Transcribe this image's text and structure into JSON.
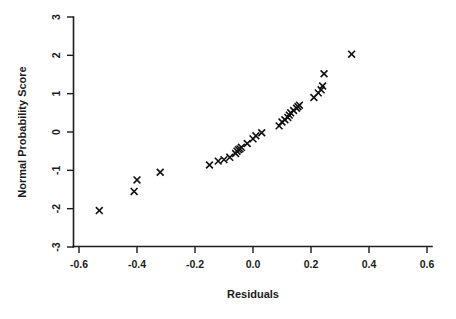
{
  "chart_data": {
    "type": "scatter",
    "title": "",
    "xlabel": "Residuals",
    "ylabel": "Normal Probability Score",
    "xlim": [
      -0.6,
      0.6
    ],
    "ylim": [
      -3,
      3
    ],
    "xticks": [
      -0.6,
      -0.4,
      -0.2,
      0.0,
      0.2,
      0.4,
      0.6
    ],
    "xticklabels": [
      "-0.6",
      "-0.4",
      "-0.2",
      "0.0",
      "0.2",
      "0.4",
      "0.6"
    ],
    "yticks": [
      -3,
      -2,
      -1,
      0,
      1,
      2,
      3
    ],
    "yticklabels": [
      "-3",
      "-2",
      "-1",
      "0",
      "1",
      "2",
      "3"
    ],
    "grid": false,
    "legend": null,
    "marker": "x",
    "marker_color": "#111111",
    "series": [
      {
        "name": "Residuals vs Normal Probability Score",
        "x": [
          -0.53,
          -0.41,
          -0.4,
          -0.32,
          -0.15,
          -0.12,
          -0.1,
          -0.08,
          -0.06,
          -0.055,
          -0.05,
          -0.045,
          -0.04,
          -0.02,
          0.0,
          0.01,
          0.03,
          0.09,
          0.1,
          0.11,
          0.12,
          0.125,
          0.13,
          0.14,
          0.15,
          0.155,
          0.16,
          0.21,
          0.225,
          0.235,
          0.24,
          0.245,
          0.34
        ],
        "y": [
          -2.05,
          -1.55,
          -1.25,
          -1.05,
          -0.86,
          -0.76,
          -0.72,
          -0.66,
          -0.56,
          -0.5,
          -0.46,
          -0.44,
          -0.4,
          -0.3,
          -0.18,
          -0.1,
          -0.02,
          0.16,
          0.26,
          0.32,
          0.38,
          0.44,
          0.5,
          0.56,
          0.62,
          0.66,
          0.7,
          0.9,
          1.02,
          1.1,
          1.2,
          1.52,
          2.03
        ]
      }
    ]
  },
  "axes": {
    "x_title": "Residuals",
    "y_title": "Normal Probability Score"
  }
}
